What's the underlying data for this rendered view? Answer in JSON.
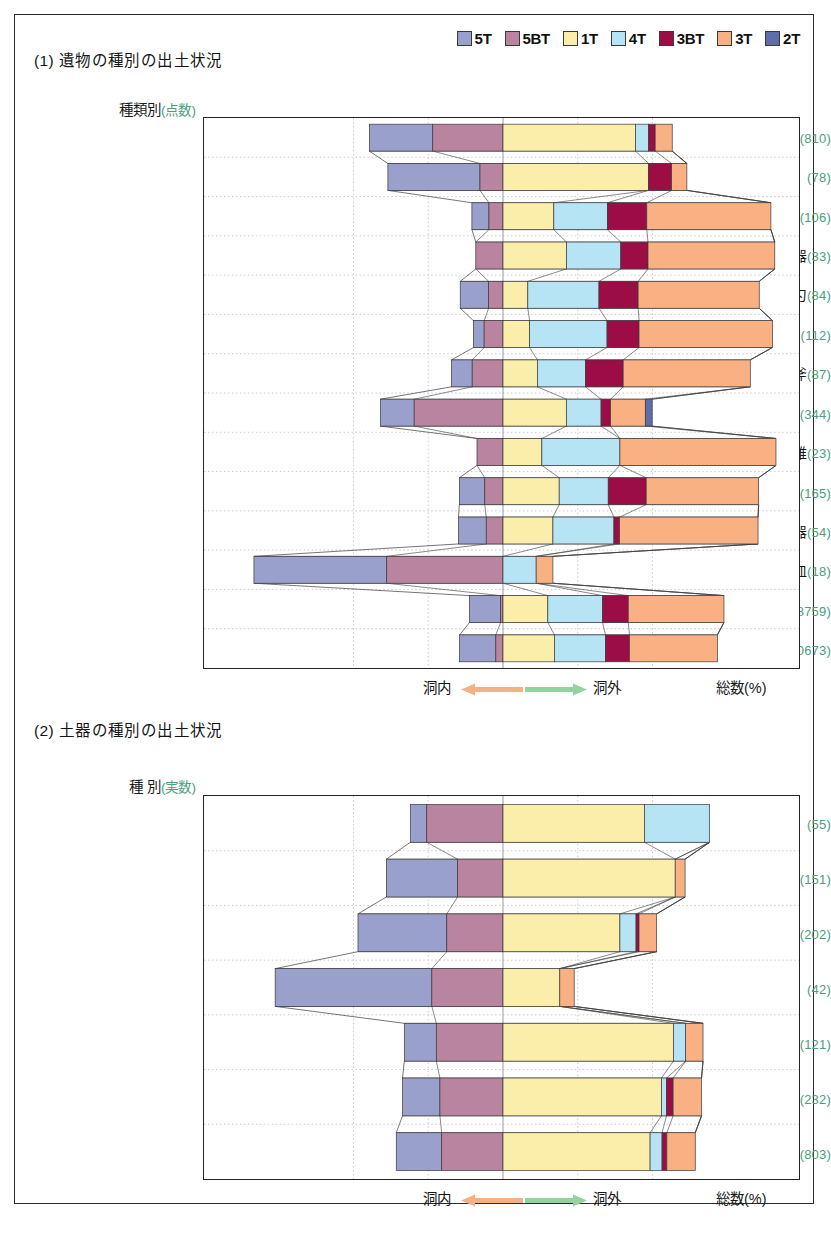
{
  "legend": {
    "items": [
      {
        "label": "5T",
        "color": "#9aa0cc"
      },
      {
        "label": "5BT",
        "color": "#b9849f"
      },
      {
        "label": "1T",
        "color": "#fbeeab"
      },
      {
        "label": "4T",
        "color": "#b7e4f5"
      },
      {
        "label": "3BT",
        "color": "#9c0d46"
      },
      {
        "label": "3T",
        "color": "#f9b184"
      },
      {
        "label": "2T",
        "color": "#5d6ea8"
      }
    ]
  },
  "section1": {
    "title": "(1) 遺物の種別の出土状況",
    "column_header": "種類別",
    "column_header_unit": "(点数)",
    "axis_left_label": "洞内",
    "axis_right_label": "洞外",
    "axis_total_label": "総数(%)",
    "left_arrow_color": "#f4b183",
    "right_arrow_color": "#92d3a0"
  },
  "section2": {
    "title": "(2) 土器の種別の出土状況",
    "column_header": "種 別",
    "column_header_unit": "(実数)",
    "axis_left_label": "洞内",
    "axis_right_label": "洞外",
    "axis_total_label": "総数(%)",
    "left_arrow_color": "#f4b183",
    "right_arrow_color": "#92d3a0"
  },
  "chart_data": [
    {
      "type": "bar",
      "orientation": "horizontal",
      "stacked": true,
      "diverging": true,
      "title": "(1) 遺物の種別の出土状況",
      "xlabel": "総数(%)",
      "ylabel": "種類別 (点数)",
      "xlim": [
        -100,
        100
      ],
      "grid": true,
      "zero_at_boundary_between": [
        "5BT",
        "1T"
      ],
      "series_order": [
        "5T",
        "5BT",
        "1T",
        "4T",
        "3BT",
        "3T",
        "2T"
      ],
      "categories": [
        "土器〔草創期〕",
        "土器〔早期以降〕",
        "尖頭器",
        "有舌尖頭器",
        "植刃",
        "棒状尖頭器",
        "石斧",
        "石鏃",
        "石錐",
        "石匙・掻器",
        "舟底形石器",
        "磨石類・石皿",
        "剥片",
        "計"
      ],
      "counts": [
        810,
        78,
        106,
        33,
        84,
        112,
        87,
        344,
        23,
        165,
        54,
        18,
        8759,
        10673
      ],
      "rows": [
        {
          "category": "土器〔草創期〕",
          "count": 810,
          "values": {
            "5T": 21.2,
            "5BT": 23.5,
            "1T": 44.3,
            "4T": 4.4,
            "3BT": 2.2,
            "3T": 5.7,
            "2T": 0
          }
        },
        {
          "category": "土器〔早期以降〕",
          "count": 78,
          "values": {
            "5T": 30.8,
            "5BT": 7.7,
            "1T": 48.7,
            "4T": 0,
            "3BT": 7.7,
            "3T": 5.1,
            "2T": 0
          }
        },
        {
          "category": "尖頭器",
          "count": 106,
          "values": {
            "5T": 5.7,
            "5BT": 4.7,
            "1T": 17.0,
            "4T": 17.9,
            "3BT": 13.2,
            "3T": 41.5,
            "2T": 0
          }
        },
        {
          "category": "有舌尖頭器",
          "count": 33,
          "values": {
            "5T": 0,
            "5BT": 9.1,
            "1T": 21.2,
            "4T": 18.2,
            "3BT": 9.1,
            "3T": 42.4,
            "2T": 0
          }
        },
        {
          "category": "植刃",
          "count": 84,
          "values": {
            "5T": 9.5,
            "5BT": 4.8,
            "1T": 8.3,
            "4T": 23.8,
            "3BT": 13.1,
            "3T": 40.5,
            "2T": 0
          }
        },
        {
          "category": "棒状尖頭器",
          "count": 112,
          "values": {
            "5T": 3.6,
            "5BT": 6.3,
            "1T": 8.9,
            "4T": 25.9,
            "3BT": 10.7,
            "3T": 44.6,
            "2T": 0
          }
        },
        {
          "category": "石斧",
          "count": 87,
          "values": {
            "5T": 6.9,
            "5BT": 10.3,
            "1T": 11.5,
            "4T": 16.1,
            "3BT": 12.6,
            "3T": 42.5,
            "2T": 0
          }
        },
        {
          "category": "石鏃",
          "count": 344,
          "values": {
            "5T": 11.3,
            "5BT": 29.7,
            "1T": 21.2,
            "4T": 11.6,
            "3BT": 3.2,
            "3T": 11.6,
            "2T": 2.3
          }
        },
        {
          "category": "石錐",
          "count": 23,
          "values": {
            "5T": 0,
            "5BT": 8.7,
            "1T": 13.0,
            "4T": 26.1,
            "3BT": 0,
            "3T": 52.2,
            "2T": 0
          }
        },
        {
          "category": "石匙・掻器",
          "count": 165,
          "values": {
            "5T": 8.5,
            "5BT": 6.1,
            "1T": 18.8,
            "4T": 16.4,
            "3BT": 12.7,
            "3T": 37.6,
            "2T": 0
          }
        },
        {
          "category": "舟底形石器",
          "count": 54,
          "values": {
            "5T": 9.3,
            "5BT": 5.6,
            "1T": 16.7,
            "4T": 20.4,
            "3BT": 1.9,
            "3T": 46.3,
            "2T": 0
          }
        },
        {
          "category": "磨石類・石皿",
          "count": 18,
          "values": {
            "5T": 44.4,
            "5BT": 38.9,
            "1T": 0,
            "4T": 11.1,
            "3BT": 0,
            "3T": 5.6,
            "2T": 0
          }
        },
        {
          "category": "剥片",
          "count": 8759,
          "values": {
            "5T": 10.4,
            "5BT": 0.8,
            "1T": 15.0,
            "4T": 18.3,
            "3BT": 8.6,
            "3T": 32.0,
            "2T": 0
          }
        },
        {
          "category": "計",
          "count": 10673,
          "values": {
            "5T": 12.1,
            "5BT": 2.4,
            "1T": 17.2,
            "4T": 17.1,
            "3BT": 8.0,
            "3T": 29.4,
            "2T": 0
          }
        }
      ]
    },
    {
      "type": "bar",
      "orientation": "horizontal",
      "stacked": true,
      "diverging": true,
      "title": "(2) 土器の種別の出土状況",
      "xlabel": "総数(%)",
      "ylabel": "種 別 (実数)",
      "xlim": [
        -100,
        100
      ],
      "grid": true,
      "zero_at_boundary_between": [
        "5BT",
        "1T"
      ],
      "series_order": [
        "5T",
        "5BT",
        "1T",
        "4T",
        "3BT",
        "3T",
        "2T"
      ],
      "categories": [
        "第Ⅰ群〔隆起線文〕",
        "第Ⅱ群〔爪形文〕",
        "第Ⅲ群〔押圧縄文〕",
        "第Ⅳ群〔櫛目文〕",
        "第Ⅴ群〔回転縄文〕",
        "第Ⅴ群〔無文〕",
        "計"
      ],
      "counts": [
        55,
        151,
        202,
        42,
        121,
        232,
        803
      ],
      "rows": [
        {
          "category": "第Ⅰ群〔隆起線文〕",
          "count": 55,
          "values": {
            "5T": 5.5,
            "5BT": 25.5,
            "1T": 47.3,
            "4T": 21.8,
            "3BT": 0,
            "3T": 0,
            "2T": 0
          }
        },
        {
          "category": "第Ⅱ群〔爪形文〕",
          "count": 151,
          "values": {
            "5T": 23.8,
            "5BT": 15.2,
            "1T": 57.6,
            "4T": 0,
            "3BT": 0,
            "3T": 3.3,
            "2T": 0
          }
        },
        {
          "category": "第Ⅲ群〔押圧縄文〕",
          "count": 202,
          "values": {
            "5T": 29.7,
            "5BT": 18.8,
            "1T": 39.1,
            "4T": 5.4,
            "3BT": 1.0,
            "3T": 5.9,
            "2T": 0
          }
        },
        {
          "category": "第Ⅳ群〔櫛目文〕",
          "count": 42,
          "values": {
            "5T": 52.4,
            "5BT": 23.8,
            "1T": 19.0,
            "4T": 0,
            "3BT": 0,
            "3T": 4.8,
            "2T": 0
          }
        },
        {
          "category": "第Ⅴ群〔回転縄文〕",
          "count": 121,
          "values": {
            "5T": 10.7,
            "5BT": 22.3,
            "1T": 57.0,
            "4T": 4.1,
            "3BT": 0,
            "3T": 5.8,
            "2T": 0
          }
        },
        {
          "category": "第Ⅴ群〔無文〕",
          "count": 232,
          "values": {
            "5T": 12.5,
            "5BT": 21.1,
            "1T": 53.0,
            "4T": 1.7,
            "3BT": 2.2,
            "3T": 9.5,
            "2T": 0
          }
        },
        {
          "category": "計",
          "count": 803,
          "values": {
            "5T": 15.2,
            "5BT": 20.5,
            "1T": 49.2,
            "4T": 4.0,
            "3BT": 1.6,
            "3T": 9.5,
            "2T": 0
          }
        }
      ]
    }
  ]
}
